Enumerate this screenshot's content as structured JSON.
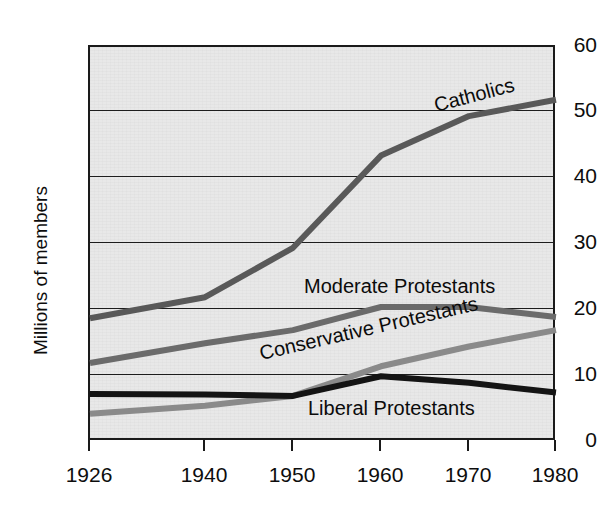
{
  "chart_data": {
    "type": "line",
    "title": "",
    "xlabel": "",
    "ylabel": "Millions of members",
    "x": [
      1926,
      1940,
      1950,
      1960,
      1970,
      1980
    ],
    "categories": [
      "1926",
      "1940",
      "1950",
      "1960",
      "1970",
      "1980"
    ],
    "xtick_labels": [
      "1926",
      "1940",
      "1950",
      "1960",
      "1970",
      "1980"
    ],
    "ytick_labels": [
      "0",
      "10",
      "20",
      "30",
      "40",
      "50",
      "60"
    ],
    "yticks": [
      0,
      10,
      20,
      30,
      40,
      50,
      60
    ],
    "ylim": [
      0,
      60
    ],
    "xlim": [
      1926,
      1980
    ],
    "grid": true,
    "legend": "inline-labels",
    "series": [
      {
        "name": "Catholics",
        "label": "Catholics",
        "color": "#595959",
        "values": [
          18.8,
          22.0,
          29.5,
          43.5,
          49.5,
          52.0
        ]
      },
      {
        "name": "Moderate Protestants",
        "label": "Moderate Protestants",
        "color": "#6b6b6b",
        "values": [
          12.0,
          15.0,
          17.0,
          20.5,
          20.5,
          19.0
        ]
      },
      {
        "name": "Conservative Protestants",
        "label": "Conservative Protestants",
        "color": "#8a8a8a",
        "values": [
          4.3,
          5.5,
          7.0,
          11.5,
          14.5,
          17.0
        ]
      },
      {
        "name": "Liberal Protestants",
        "label": "Liberal Protestants",
        "color": "#141414",
        "values": [
          7.3,
          7.2,
          7.0,
          10.0,
          9.0,
          7.5
        ]
      }
    ]
  },
  "axis": {
    "ylabel": "Millions of members"
  }
}
